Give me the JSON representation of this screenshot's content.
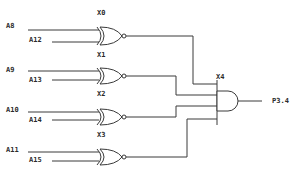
{
  "diagram": {
    "type": "logic-circuit",
    "gates": [
      {
        "id": "X0",
        "kind": "XNOR",
        "inputs": [
          "A8",
          "A12"
        ]
      },
      {
        "id": "X1",
        "kind": "XNOR",
        "inputs": [
          "A9",
          "A13"
        ]
      },
      {
        "id": "X2",
        "kind": "XNOR",
        "inputs": [
          "A10",
          "A14"
        ]
      },
      {
        "id": "X3",
        "kind": "XNOR",
        "inputs": [
          "A11",
          "A15"
        ]
      },
      {
        "id": "X4",
        "kind": "AND",
        "inputs": [
          "X0",
          "X1",
          "X2",
          "X3"
        ],
        "output": "P3.4"
      }
    ],
    "labels": {
      "A8": "A8",
      "A12": "A12",
      "X0": "X0",
      "A9": "A9",
      "A13": "A13",
      "X1": "X1",
      "A10": "A10",
      "A14": "A14",
      "X2": "X2",
      "A11": "A11",
      "A15": "A15",
      "X3": "X3",
      "X4": "X4",
      "output": "P3.4"
    },
    "wire_color": "#3a3a3a"
  }
}
